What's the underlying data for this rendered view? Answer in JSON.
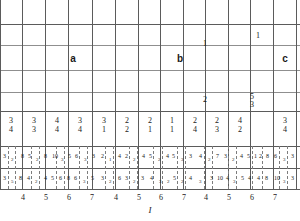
{
  "figure": {
    "axis_title": "I",
    "region_labels": [
      {
        "text": "a",
        "x": 73,
        "y": 60
      },
      {
        "text": "b",
        "x": 180,
        "y": 60
      },
      {
        "text": "c",
        "x": 283,
        "y": 60
      }
    ],
    "upper_marks": [
      {
        "text": "1",
        "x": 205,
        "y": 44
      },
      {
        "text": "1",
        "x": 258,
        "y": 37
      }
    ],
    "mid_marks": [
      {
        "text": "2",
        "x": 205,
        "y": 99
      },
      {
        "text": "5",
        "x": 252,
        "y": 96
      },
      {
        "text": "3",
        "x": 252,
        "y": 104
      }
    ],
    "time_signatures": [
      {
        "num": "3",
        "den": "4"
      },
      {
        "num": "3",
        "den": "3"
      },
      {
        "num": "4",
        "den": "4"
      },
      {
        "num": "3",
        "den": "4"
      },
      {
        "num": "3",
        "den": "1"
      },
      {
        "num": "2",
        "den": "2"
      },
      {
        "num": "2",
        "den": "1"
      },
      {
        "num": "1",
        "den": "1"
      },
      {
        "num": "2",
        "den": "4"
      },
      {
        "num": "2",
        "den": "3"
      },
      {
        "num": "4",
        "den": "2"
      },
      {
        "num": "3",
        "den": "4"
      }
    ],
    "row_upper_digits": [
      {
        "text": "3",
        "x": 3,
        "sub": false
      },
      {
        "text": "2",
        "x": 11,
        "sub": true
      },
      {
        "text": "8",
        "x": 21,
        "sub": false
      },
      {
        "text": "5",
        "x": 28,
        "sub": false
      },
      {
        "text": "2",
        "x": 36,
        "sub": true
      },
      {
        "text": "8",
        "x": 44,
        "sub": false
      },
      {
        "text": "10",
        "x": 52,
        "sub": false
      },
      {
        "text": "3",
        "x": 61,
        "sub": true
      },
      {
        "text": "5",
        "x": 68,
        "sub": false
      },
      {
        "text": "6",
        "x": 75,
        "sub": false
      },
      {
        "text": "3",
        "x": 84,
        "sub": true
      },
      {
        "text": "3",
        "x": 92,
        "sub": false
      },
      {
        "text": "2",
        "x": 101,
        "sub": false
      },
      {
        "text": "1",
        "x": 109,
        "sub": true
      },
      {
        "text": "4",
        "x": 118,
        "sub": false
      },
      {
        "text": "2",
        "x": 125,
        "sub": false
      },
      {
        "text": "2",
        "x": 133,
        "sub": true
      },
      {
        "text": "4",
        "x": 142,
        "sub": false
      },
      {
        "text": "5",
        "x": 149,
        "sub": false
      },
      {
        "text": "2",
        "x": 158,
        "sub": true
      },
      {
        "text": "4",
        "x": 166,
        "sub": false
      },
      {
        "text": "5",
        "x": 172,
        "sub": false
      },
      {
        "text": "3",
        "x": 181,
        "sub": true
      },
      {
        "text": "3",
        "x": 189,
        "sub": false
      },
      {
        "text": "4",
        "x": 199,
        "sub": false
      },
      {
        "text": "2",
        "x": 208,
        "sub": true
      },
      {
        "text": "7",
        "x": 216,
        "sub": false
      },
      {
        "text": "3",
        "x": 224,
        "sub": false
      },
      {
        "text": "2",
        "x": 232,
        "sub": true
      },
      {
        "text": "4",
        "x": 240,
        "sub": false
      },
      {
        "text": "5",
        "x": 247,
        "sub": false
      },
      {
        "text": "1",
        "x": 254,
        "sub": false
      },
      {
        "text": "2",
        "x": 259,
        "sub": false
      },
      {
        "text": "8",
        "x": 266,
        "sub": false
      },
      {
        "text": "6",
        "x": 274,
        "sub": false
      },
      {
        "text": "3",
        "x": 283,
        "sub": true
      },
      {
        "text": "3",
        "x": 291,
        "sub": false
      }
    ],
    "row_lower_digits": [
      {
        "text": "3",
        "x": 3,
        "sub": false
      },
      {
        "text": "5",
        "x": 11,
        "sub": true
      },
      {
        "text": "8",
        "x": 19,
        "sub": false
      },
      {
        "text": "4",
        "x": 27,
        "sub": false
      },
      {
        "text": "2",
        "x": 35,
        "sub": true
      },
      {
        "text": "4",
        "x": 44,
        "sub": false
      },
      {
        "text": "5",
        "x": 51,
        "sub": false
      },
      {
        "text": "6",
        "x": 59,
        "sub": false
      },
      {
        "text": "8",
        "x": 67,
        "sub": false
      },
      {
        "text": "6",
        "x": 74,
        "sub": false
      },
      {
        "text": "3",
        "x": 83,
        "sub": true
      },
      {
        "text": "5",
        "x": 91,
        "sub": false
      },
      {
        "text": "3",
        "x": 101,
        "sub": false
      },
      {
        "text": "2",
        "x": 109,
        "sub": true
      },
      {
        "text": "6",
        "x": 118,
        "sub": false
      },
      {
        "text": "3",
        "x": 125,
        "sub": false
      },
      {
        "text": "2",
        "x": 133,
        "sub": true
      },
      {
        "text": "3",
        "x": 141,
        "sub": false
      },
      {
        "text": "4",
        "x": 150,
        "sub": false
      },
      {
        "text": "3",
        "x": 159,
        "sub": true
      },
      {
        "text": "2",
        "x": 167,
        "sub": true
      },
      {
        "text": "5",
        "x": 173,
        "sub": false
      },
      {
        "text": "2",
        "x": 181,
        "sub": true
      },
      {
        "text": "4",
        "x": 189,
        "sub": false
      },
      {
        "text": "3",
        "x": 199,
        "sub": true
      },
      {
        "text": "3",
        "x": 210,
        "sub": false
      },
      {
        "text": "10",
        "x": 217,
        "sub": false
      },
      {
        "text": "4",
        "x": 226,
        "sub": false
      },
      {
        "text": "3",
        "x": 233,
        "sub": true
      },
      {
        "text": "5",
        "x": 241,
        "sub": false
      },
      {
        "text": "4",
        "x": 248,
        "sub": false
      },
      {
        "text": "4",
        "x": 257,
        "sub": false
      },
      {
        "text": "8",
        "x": 265,
        "sub": false
      },
      {
        "text": "10",
        "x": 274,
        "sub": false
      },
      {
        "text": "3",
        "x": 283,
        "sub": true
      },
      {
        "text": "3",
        "x": 291,
        "sub": false
      }
    ],
    "tick_labels": [
      "4",
      "5",
      "6",
      "7",
      "4",
      "5",
      "6",
      "7",
      "4",
      "5",
      "6",
      "7"
    ]
  }
}
